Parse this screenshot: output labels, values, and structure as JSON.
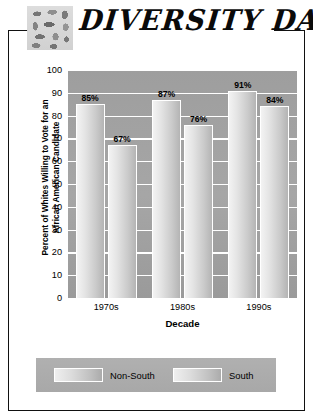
{
  "header": {
    "title": "DIVERSITY DATA",
    "logo_icon": "mosaic-tiles-icon"
  },
  "chart_data": {
    "type": "bar",
    "title": "",
    "xlabel": "Decade",
    "ylabel": "Percent of Whites Willing to Vote for an African American Candidate",
    "categories": [
      "1970s",
      "1980s",
      "1990s"
    ],
    "series": [
      {
        "name": "Non-South",
        "values": [
          85,
          87,
          91
        ],
        "labels": [
          "85%",
          "87%",
          "91%"
        ]
      },
      {
        "name": "South",
        "values": [
          67,
          76,
          84
        ],
        "labels": [
          "67%",
          "76%",
          "84%"
        ]
      }
    ],
    "ylim": [
      0,
      100
    ],
    "yticks": [
      0,
      10,
      20,
      30,
      40,
      50,
      60,
      70,
      80,
      90,
      100
    ],
    "ytick_labels": [
      "0",
      "10",
      "20",
      "30",
      "40",
      "50",
      "60",
      "70",
      "80",
      "90",
      "100"
    ],
    "grid": true,
    "legend_position": "bottom",
    "plot_background": "#a3a3a3",
    "grid_color": "#ffffff",
    "bar_color": "#dcdcdc"
  },
  "legend": {
    "items": [
      {
        "label": "Non-South",
        "swatch": "bar-swatch-non-south"
      },
      {
        "label": "South",
        "swatch": "bar-swatch-south"
      }
    ]
  }
}
